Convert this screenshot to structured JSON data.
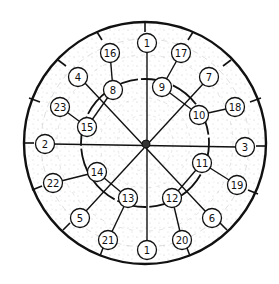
{
  "diagram": {
    "title": "",
    "center": {
      "x": 145,
      "y": 143
    },
    "outer_radius": 121,
    "inner_ring_radius": 64,
    "colors": {
      "ink": "#111111",
      "paper": "#ffffff",
      "texture": "#8a8a8a"
    },
    "nodes": [
      {
        "id": "n1top",
        "label": "1",
        "x": 147,
        "y": 43
      },
      {
        "id": "n16",
        "label": "16",
        "x": 110,
        "y": 53
      },
      {
        "id": "n17",
        "label": "17",
        "x": 181,
        "y": 53
      },
      {
        "id": "n4",
        "label": "4",
        "x": 78,
        "y": 77
      },
      {
        "id": "n8",
        "label": "8",
        "x": 113,
        "y": 90
      },
      {
        "id": "n9",
        "label": "9",
        "x": 162,
        "y": 87
      },
      {
        "id": "n7",
        "label": "7",
        "x": 209,
        "y": 77
      },
      {
        "id": "n23",
        "label": "23",
        "x": 60,
        "y": 107
      },
      {
        "id": "n15",
        "label": "15",
        "x": 87,
        "y": 127
      },
      {
        "id": "n10",
        "label": "10",
        "x": 199,
        "y": 115
      },
      {
        "id": "n18",
        "label": "18",
        "x": 235,
        "y": 107
      },
      {
        "id": "n2",
        "label": "2",
        "x": 45,
        "y": 144
      },
      {
        "id": "n3",
        "label": "3",
        "x": 245,
        "y": 147
      },
      {
        "id": "n14",
        "label": "14",
        "x": 97,
        "y": 172
      },
      {
        "id": "n11",
        "label": "11",
        "x": 202,
        "y": 163
      },
      {
        "id": "n22",
        "label": "22",
        "x": 53,
        "y": 183
      },
      {
        "id": "n19",
        "label": "19",
        "x": 237,
        "y": 185
      },
      {
        "id": "n13",
        "label": "13",
        "x": 128,
        "y": 198
      },
      {
        "id": "n12",
        "label": "12",
        "x": 172,
        "y": 198
      },
      {
        "id": "n5",
        "label": "5",
        "x": 80,
        "y": 218
      },
      {
        "id": "n6",
        "label": "6",
        "x": 212,
        "y": 218
      },
      {
        "id": "n21",
        "label": "21",
        "x": 108,
        "y": 240
      },
      {
        "id": "n1bot",
        "label": "1",
        "x": 147,
        "y": 250
      },
      {
        "id": "n20",
        "label": "20",
        "x": 182,
        "y": 240
      }
    ]
  }
}
